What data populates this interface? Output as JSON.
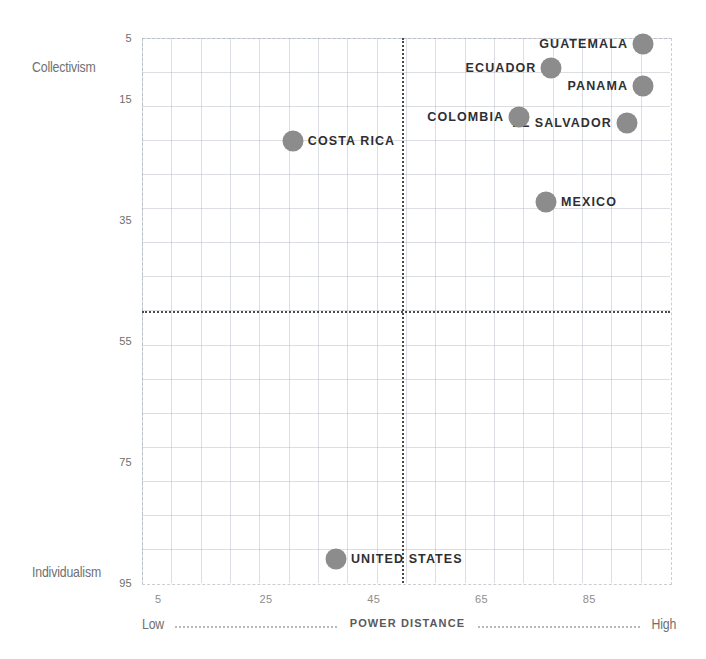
{
  "chart_data": {
    "type": "scatter",
    "title": "",
    "xlabel": "POWER DISTANCE",
    "ylabel": "",
    "xlim": [
      2,
      100
    ],
    "ylim": [
      5,
      95
    ],
    "grid": true,
    "legend": "none",
    "y_axis_top_label": "Collectivism",
    "y_axis_bottom_label": "Individualism",
    "x_axis_low_label": "Low",
    "x_axis_high_label": "High",
    "xticks": [
      5,
      25,
      45,
      65,
      85
    ],
    "xtick_labels": [
      "5",
      "25",
      "45",
      "65",
      "85"
    ],
    "yticks": [
      5,
      15,
      35,
      55,
      75,
      95
    ],
    "ytick_labels": [
      "5",
      "15",
      "35",
      "55",
      "75",
      "95"
    ],
    "reference_lines": {
      "x": 50,
      "y": 50
    },
    "point_color": "#8c8c8c",
    "label_color": "#2f2f33",
    "points": [
      {
        "label": "GUATEMALA",
        "x": 95,
        "y": 6,
        "label_side": "left"
      },
      {
        "label": "PANAMA",
        "x": 95,
        "y": 13,
        "label_side": "left"
      },
      {
        "label": "ECUADOR",
        "x": 78,
        "y": 10,
        "label_side": "left"
      },
      {
        "label": "EL SALVADOR",
        "x": 92,
        "y": 19,
        "label_side": "left"
      },
      {
        "label": "COLOMBIA",
        "x": 72,
        "y": 18,
        "label_side": "left"
      },
      {
        "label": "COSTA RICA",
        "x": 30,
        "y": 22,
        "label_side": "right"
      },
      {
        "label": "MEXICO",
        "x": 77,
        "y": 32,
        "label_side": "right"
      },
      {
        "label": "UNITED STATES",
        "x": 38,
        "y": 91,
        "label_side": "right"
      }
    ]
  }
}
